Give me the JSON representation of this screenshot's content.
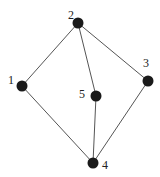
{
  "diagram": {
    "type": "graph",
    "nodes": [
      {
        "id": "1",
        "label": "1",
        "x": 22,
        "y": 86,
        "label_x": 8,
        "label_y": 84
      },
      {
        "id": "2",
        "label": "2",
        "x": 78,
        "y": 23,
        "label_x": 68,
        "label_y": 19
      },
      {
        "id": "3",
        "label": "3",
        "x": 148,
        "y": 81,
        "label_x": 143,
        "label_y": 67
      },
      {
        "id": "4",
        "label": "4",
        "x": 93,
        "y": 163,
        "label_x": 102,
        "label_y": 169
      },
      {
        "id": "5",
        "label": "5",
        "x": 96,
        "y": 96,
        "label_x": 79,
        "label_y": 98
      }
    ],
    "edges": [
      {
        "from": "1",
        "to": "2"
      },
      {
        "from": "2",
        "to": "3"
      },
      {
        "from": "2",
        "to": "5"
      },
      {
        "from": "1",
        "to": "4"
      },
      {
        "from": "5",
        "to": "4"
      },
      {
        "from": "3",
        "to": "4"
      }
    ],
    "colors": {
      "node": "#1a1a1a",
      "edge": "#555555",
      "label": "#222222"
    },
    "node_radius": 5.5
  }
}
